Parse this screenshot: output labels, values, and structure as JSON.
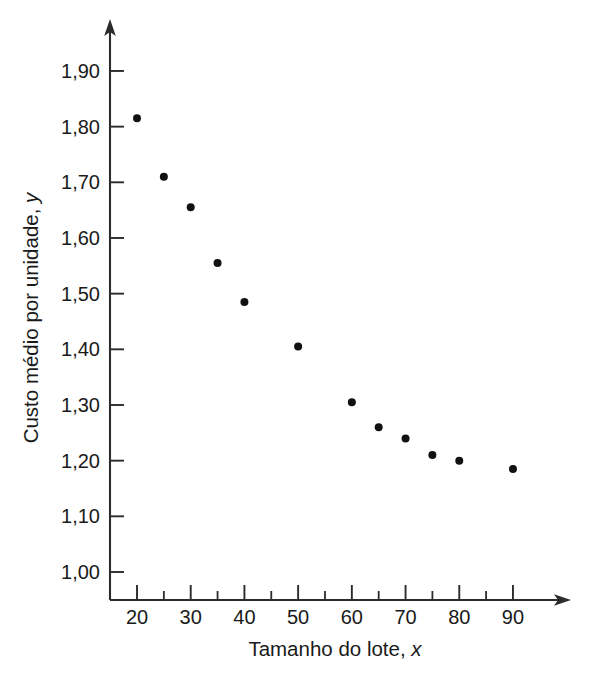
{
  "chart_data": {
    "type": "scatter",
    "title": "",
    "xlabel": "Tamanho do lote, x",
    "xlabel_main": "Tamanho do lote, ",
    "xlabel_var": "x",
    "ylabel": "Custo médio por unidade, y",
    "ylabel_main": "Custo médio por unidade, ",
    "ylabel_var": "y",
    "xlim": [
      15.5,
      95
    ],
    "ylim": [
      0.955,
      1.945
    ],
    "grid": false,
    "legend": null,
    "decimal_separator": ",",
    "marker": {
      "shape": "circle",
      "color": "#111111",
      "size_px": 8
    },
    "x_ticks_major": [
      20,
      30,
      40,
      50,
      60,
      70,
      80,
      90
    ],
    "x_tick_labels": [
      "20",
      "30",
      "40",
      "50",
      "60",
      "70",
      "80",
      "90"
    ],
    "x_ticks_minor": [
      25,
      35,
      45,
      55,
      65,
      75,
      85
    ],
    "y_ticks_major": [
      1.0,
      1.1,
      1.2,
      1.3,
      1.4,
      1.5,
      1.6,
      1.7,
      1.8,
      1.9
    ],
    "y_tick_labels": [
      "1,00",
      "1,10",
      "1,20",
      "1,30",
      "1,40",
      "1,50",
      "1,60",
      "1,70",
      "1,80",
      "1,90"
    ],
    "x": [
      20,
      25,
      30,
      35,
      40,
      50,
      60,
      65,
      70,
      75,
      80,
      90
    ],
    "y": [
      1.815,
      1.71,
      1.655,
      1.555,
      1.485,
      1.405,
      1.305,
      1.26,
      1.24,
      1.21,
      1.2,
      1.185
    ],
    "points": [
      {
        "x": 20,
        "y": 1.815
      },
      {
        "x": 25,
        "y": 1.71
      },
      {
        "x": 30,
        "y": 1.655
      },
      {
        "x": 35,
        "y": 1.555
      },
      {
        "x": 40,
        "y": 1.485
      },
      {
        "x": 50,
        "y": 1.405
      },
      {
        "x": 60,
        "y": 1.305
      },
      {
        "x": 65,
        "y": 1.26
      },
      {
        "x": 70,
        "y": 1.24
      },
      {
        "x": 75,
        "y": 1.21
      },
      {
        "x": 80,
        "y": 1.2
      },
      {
        "x": 90,
        "y": 1.185
      }
    ],
    "axis_color": "#2b2b2b",
    "axes_have_arrowheads": true
  },
  "geometry": {
    "x_axis_y_px": 600,
    "y_axis_x_px": 110,
    "x_px_at_20": 137,
    "x_px_per_unit": 5.371,
    "y_px_at_1_00": 572,
    "y_px_per_unit": 556.7
  }
}
